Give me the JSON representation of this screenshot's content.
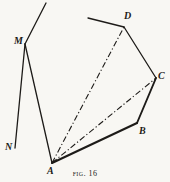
{
  "figure": {
    "caption_prefix": "Fig.",
    "caption_number": "16",
    "background_color": "#f8f7f3",
    "ink_color": "#1d1b18",
    "width": 170,
    "height": 182
  },
  "vertices": [
    {
      "id": "M",
      "label": "M",
      "x": 25,
      "y": 44
    },
    {
      "id": "N",
      "label": "N",
      "x": 15,
      "y": 148
    },
    {
      "id": "A",
      "label": "A",
      "x": 52,
      "y": 163
    },
    {
      "id": "B",
      "label": "B",
      "x": 137,
      "y": 123
    },
    {
      "id": "C",
      "label": "C",
      "x": 156,
      "y": 78
    },
    {
      "id": "D",
      "label": "D",
      "x": 124,
      "y": 27
    }
  ],
  "open_endpoints": [
    {
      "id": "M-tail",
      "x": 46,
      "y": 3,
      "note": "free end of segment above M"
    },
    {
      "id": "D-tail",
      "x": 88,
      "y": 18,
      "note": "free end of segment left of D"
    }
  ],
  "segments": [
    {
      "id": "tail-M",
      "from": "M-tail",
      "to": "M",
      "style": "solid",
      "weight": 1.3
    },
    {
      "id": "M-N",
      "from": "M",
      "to": "N",
      "style": "solid",
      "weight": 1.3
    },
    {
      "id": "M-A",
      "from": "M",
      "to": "A",
      "style": "solid",
      "weight": 1.3
    },
    {
      "id": "tail-D",
      "from": "D-tail",
      "to": "D",
      "style": "solid",
      "weight": 1.3
    },
    {
      "id": "D-C",
      "from": "D",
      "to": "C",
      "style": "solid",
      "weight": 1.3
    },
    {
      "id": "C-B",
      "from": "C",
      "to": "B",
      "style": "solid",
      "weight": 1.9
    },
    {
      "id": "B-A",
      "from": "B",
      "to": "A",
      "style": "solid",
      "weight": 2.1
    },
    {
      "id": "A-D",
      "from": "A",
      "to": "D",
      "style": "dash-dot",
      "weight": 1.1
    },
    {
      "id": "A-C",
      "from": "A",
      "to": "C",
      "style": "dash-dot",
      "weight": 1.1
    }
  ]
}
